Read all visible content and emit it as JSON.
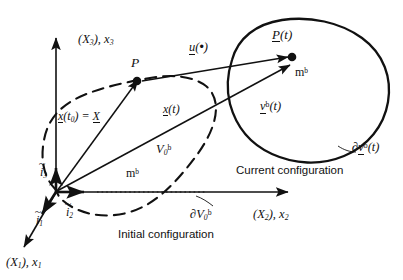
{
  "figure": {
    "type": "continuum-mechanics-configuration-diagram"
  },
  "axes": {
    "x3": {
      "label_paren": "(X",
      "label_paren_sub": "3",
      "label_paren_close": "), ",
      "label_main": "x",
      "label_main_sub": "3"
    },
    "x2": {
      "label_paren": "(X",
      "label_paren_sub": "2",
      "label_paren_close": "), ",
      "label_main": "x",
      "label_main_sub": "2"
    },
    "x1": {
      "label_paren": "(X",
      "label_paren_sub": "1",
      "label_paren_close": "), ",
      "label_main": "x",
      "label_main_sub": "1"
    }
  },
  "basis": {
    "i1": {
      "symbol": "i",
      "sub": "1"
    },
    "i2": {
      "symbol": "i",
      "sub": "2"
    },
    "i3": {
      "symbol": "i",
      "sub": "3"
    }
  },
  "initial": {
    "caption": "Initial configuration",
    "point_label": "P",
    "volume": {
      "symbol": "V",
      "sub": "0",
      "sup": "b"
    },
    "mass": {
      "symbol": "m",
      "sup": "b"
    },
    "boundary": {
      "partial": "∂",
      "symbol": "V",
      "sub": "0",
      "sup": "b"
    },
    "position_vector": {
      "x": "x",
      "t0_open": "(",
      "t0": "t",
      "t0_sub": "0",
      "t0_close": ")",
      "equals": " = ",
      "X": "X"
    }
  },
  "current": {
    "caption": "Current configuration",
    "point_label": {
      "symbol": "P",
      "arg": "(t)"
    },
    "volume": {
      "symbol": "v",
      "sup": "b",
      "arg": "(t)"
    },
    "mass": {
      "symbol": "m",
      "sup": "b"
    },
    "boundary": {
      "partial": "∂",
      "symbol": "v",
      "sup": "b",
      "arg": "(t)"
    },
    "position_vector": {
      "x": "x",
      "arg_open": "(",
      "arg": "t",
      "arg_close": ")"
    }
  },
  "displacement": {
    "symbol": "u",
    "arg_open": "(",
    "arg_dot": "•",
    "arg_close": ")"
  },
  "colors": {
    "stroke": "#111111",
    "background": "#ffffff"
  }
}
